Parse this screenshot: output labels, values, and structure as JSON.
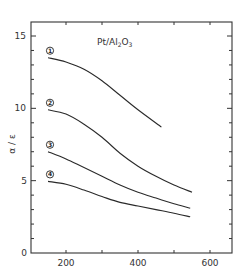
{
  "chart_data": {
    "type": "line",
    "title": "Pt/Al2O3",
    "title_main": "Pt/Al",
    "title_sub1": "2",
    "title_mid": "O",
    "title_sub2": "3",
    "xlabel": "",
    "ylabel": "α / ε",
    "xlim": [
      100,
      660
    ],
    "ylim": [
      0,
      16
    ],
    "x_ticks": [
      200,
      400,
      600
    ],
    "x_minor_ticks": [
      300,
      500
    ],
    "y_ticks": [
      0,
      5,
      10,
      15
    ],
    "y_minor_step": 1,
    "grid": false,
    "legend": "inline circled numbers next to each curve",
    "series": [
      {
        "name": "1",
        "x": [
          150,
          200,
          250,
          300,
          350,
          400,
          465
        ],
        "y": [
          13.5,
          13.2,
          12.7,
          11.9,
          10.9,
          9.9,
          8.7
        ]
      },
      {
        "name": "2",
        "x": [
          150,
          200,
          250,
          300,
          350,
          400,
          450,
          500,
          550
        ],
        "y": [
          9.9,
          9.6,
          8.9,
          8.0,
          6.9,
          6.0,
          5.3,
          4.7,
          4.2
        ]
      },
      {
        "name": "3",
        "x": [
          150,
          200,
          250,
          300,
          350,
          400,
          450,
          500,
          545
        ],
        "y": [
          7.0,
          6.5,
          5.9,
          5.3,
          4.7,
          4.2,
          3.8,
          3.4,
          3.1
        ]
      },
      {
        "name": "4",
        "x": [
          150,
          200,
          250,
          300,
          350,
          400,
          450,
          500,
          545
        ],
        "y": [
          4.95,
          4.75,
          4.35,
          3.9,
          3.5,
          3.25,
          3.0,
          2.75,
          2.5
        ]
      }
    ]
  }
}
